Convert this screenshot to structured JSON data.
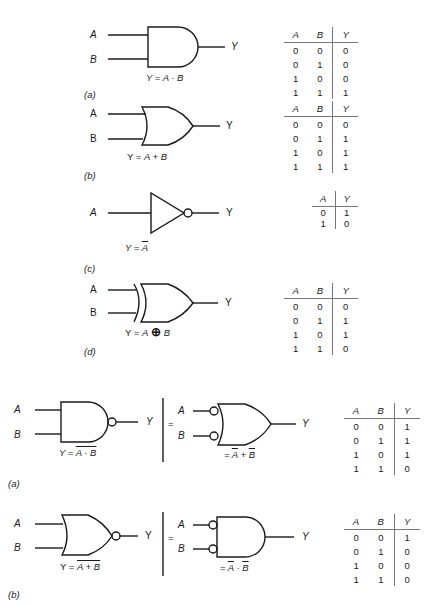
{
  "figure1": {
    "a": {
      "gate": "AND",
      "inputs": [
        "A",
        "B"
      ],
      "output": "Y",
      "equation": {
        "lhs": "Y = ",
        "a": "A",
        "op": " · ",
        "b": "B"
      },
      "tag": "(a)",
      "truth_table": {
        "headers": [
          "A",
          "B",
          "Y"
        ],
        "rows": [
          [
            "0",
            "0",
            "0"
          ],
          [
            "0",
            "1",
            "0"
          ],
          [
            "1",
            "0",
            "0"
          ],
          [
            "1",
            "1",
            "1"
          ]
        ]
      }
    },
    "b": {
      "gate": "OR",
      "inputs": [
        "A",
        "B"
      ],
      "output": "Y",
      "equation": {
        "lhs": "Y = ",
        "a": "A",
        "op": " + ",
        "b": "B"
      },
      "tag": "(b)",
      "truth_table": {
        "headers": [
          "A",
          "B",
          "Y"
        ],
        "rows": [
          [
            "0",
            "0",
            "0"
          ],
          [
            "0",
            "1",
            "1"
          ],
          [
            "1",
            "0",
            "1"
          ],
          [
            "1",
            "1",
            "1"
          ]
        ]
      }
    },
    "c": {
      "gate": "NOT",
      "inputs": [
        "A"
      ],
      "output": "Y",
      "equation": {
        "lhs": "Y = ",
        "a": "A"
      },
      "tag": "(c)",
      "truth_table": {
        "headers": [
          "A",
          "Y"
        ],
        "rows": [
          [
            "0",
            "1"
          ],
          [
            "1",
            "0"
          ]
        ]
      }
    },
    "d": {
      "gate": "XOR",
      "inputs": [
        "A",
        "B"
      ],
      "output": "Y",
      "equation": {
        "lhs": "Y = ",
        "a": "A",
        "op": "⊕",
        "b": "B"
      },
      "tag": "(d)",
      "truth_table": {
        "headers": [
          "A",
          "B",
          "Y"
        ],
        "rows": [
          [
            "0",
            "0",
            "0"
          ],
          [
            "0",
            "1",
            "1"
          ],
          [
            "1",
            "0",
            "1"
          ],
          [
            "1",
            "1",
            "0"
          ]
        ]
      }
    }
  },
  "figure2": {
    "a": {
      "gate": "NAND",
      "inputs": [
        "A",
        "B"
      ],
      "output": "Y",
      "equation": {
        "lhs": "Y = ",
        "expr": "A · B"
      },
      "equivalent": {
        "gate": "OR with inverted inputs",
        "inputs": [
          "A",
          "B"
        ],
        "output": "Y",
        "eq_sign": "=",
        "equation": {
          "lhs": "= ",
          "a": "A",
          "op": " + ",
          "b": "B"
        }
      },
      "tag": "(a)",
      "truth_table": {
        "headers": [
          "A",
          "B",
          "Y"
        ],
        "rows": [
          [
            "0",
            "0",
            "1"
          ],
          [
            "0",
            "1",
            "1"
          ],
          [
            "1",
            "0",
            "1"
          ],
          [
            "1",
            "1",
            "0"
          ]
        ]
      }
    },
    "b": {
      "gate": "NOR",
      "inputs": [
        "A",
        "B"
      ],
      "output": "Y",
      "equation": {
        "lhs": "Y = ",
        "expr": "A + B"
      },
      "equivalent": {
        "gate": "AND with inverted inputs",
        "inputs": [
          "A",
          "B"
        ],
        "output": "Y",
        "eq_sign": "=",
        "equation": {
          "lhs": "= ",
          "a": "A",
          "op": " · ",
          "b": "B"
        }
      },
      "tag": "(b)",
      "truth_table": {
        "headers": [
          "A",
          "B",
          "Y"
        ],
        "rows": [
          [
            "0",
            "0",
            "1"
          ],
          [
            "0",
            "1",
            "0"
          ],
          [
            "1",
            "0",
            "0"
          ],
          [
            "1",
            "1",
            "0"
          ]
        ]
      }
    }
  },
  "colors": {
    "ink": "#1a1a1a",
    "rule": "#777777",
    "background": "#ffffff"
  }
}
